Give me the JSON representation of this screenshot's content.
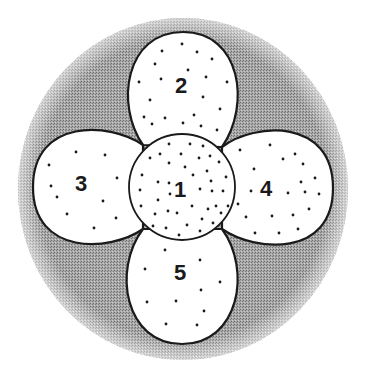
{
  "diagram": {
    "colors": {
      "background": "#ffffff",
      "outer_disc": "#9a9a9a",
      "region_fill": "#ffffff",
      "outline": "#1a1a1a",
      "dot": "#1a1a1a"
    },
    "outer_disc": {
      "cx": 183,
      "cy": 189,
      "rx": 165,
      "ry": 171
    },
    "center_region": {
      "label": "1",
      "cx": 182,
      "cy": 187,
      "r": 53,
      "label_pos": [
        180,
        190
      ],
      "dots": [
        [
          152,
          124
        ],
        [
          183,
          123
        ],
        [
          201,
          126
        ],
        [
          169,
          144
        ],
        [
          190,
          144
        ],
        [
          203,
          146
        ],
        [
          160,
          154
        ],
        [
          181,
          154
        ],
        [
          150,
          158
        ],
        [
          199,
          158
        ],
        [
          210,
          156
        ],
        [
          219,
          162
        ],
        [
          169,
          163
        ],
        [
          185,
          167
        ],
        [
          207,
          171
        ],
        [
          142,
          175
        ],
        [
          193,
          175
        ],
        [
          226,
          177
        ],
        [
          158,
          182
        ],
        [
          169,
          183
        ],
        [
          211,
          181
        ],
        [
          140,
          190
        ],
        [
          200,
          189
        ],
        [
          170,
          194
        ],
        [
          212,
          191
        ],
        [
          223,
          191
        ],
        [
          158,
          200
        ],
        [
          141,
          206
        ],
        [
          192,
          206
        ],
        [
          208,
          209
        ],
        [
          216,
          206
        ],
        [
          228,
          206
        ],
        [
          168,
          211
        ],
        [
          177,
          213
        ],
        [
          155,
          214
        ],
        [
          221,
          213
        ],
        [
          202,
          219
        ],
        [
          187,
          225
        ],
        [
          153,
          226
        ],
        [
          166,
          228
        ],
        [
          213,
          223
        ],
        [
          200,
          231
        ],
        [
          179,
          235
        ]
      ]
    },
    "petals": [
      {
        "id": "top",
        "label": "2",
        "path": "M143,145 C115,105 125,32 183,32 C241,32 251,105 222,147 Z",
        "label_pos": [
          181,
          86
        ],
        "dots": [
          [
            182,
            44
          ],
          [
            162,
            51
          ],
          [
            197,
            52
          ],
          [
            212,
            59
          ],
          [
            155,
            64
          ],
          [
            188,
            70
          ],
          [
            161,
            79
          ],
          [
            206,
            77
          ],
          [
            139,
            82
          ],
          [
            227,
            82
          ],
          [
            150,
            100
          ],
          [
            203,
            97
          ],
          [
            144,
            117
          ],
          [
            220,
            109
          ],
          [
            165,
            118
          ],
          [
            194,
            115
          ],
          [
            217,
            130
          ]
        ]
      },
      {
        "id": "left",
        "label": "3",
        "path": "M143,145 C110,122 33,118 33,187 C33,256 110,252 143,229 Z",
        "label_pos": [
          81,
          184
        ],
        "dots": [
          [
            76,
            152
          ],
          [
            105,
            155
          ],
          [
            49,
            165
          ],
          [
            117,
            178
          ],
          [
            51,
            186
          ],
          [
            57,
            197
          ],
          [
            103,
            201
          ],
          [
            67,
            214
          ],
          [
            116,
            218
          ],
          [
            94,
            228
          ]
        ]
      },
      {
        "id": "right",
        "label": "4",
        "path": "M222,147 C255,122 333,118 333,188 C333,258 255,252 222,229 Z",
        "label_pos": [
          266,
          189
        ],
        "dots": [
          [
            270,
            145
          ],
          [
            240,
            150
          ],
          [
            295,
            154
          ],
          [
            283,
            159
          ],
          [
            303,
            164
          ],
          [
            254,
            169
          ],
          [
            315,
            178
          ],
          [
            301,
            182
          ],
          [
            251,
            191
          ],
          [
            288,
            193
          ],
          [
            305,
            192
          ],
          [
            319,
            194
          ],
          [
            238,
            204
          ],
          [
            309,
            209
          ],
          [
            246,
            217
          ],
          [
            272,
            216
          ],
          [
            293,
            215
          ],
          [
            298,
            229
          ],
          [
            255,
            233
          ],
          [
            279,
            233
          ]
        ]
      },
      {
        "id": "bottom",
        "label": "5",
        "path": "M143,229 C112,270 125,344 182,344 C239,344 252,270 222,229 Z",
        "label_pos": [
          180,
          273
        ],
        "dots": [
          [
            165,
            250
          ],
          [
            200,
            260
          ],
          [
            145,
            269
          ],
          [
            220,
            282
          ],
          [
            201,
            290
          ],
          [
            147,
            302
          ],
          [
            176,
            301
          ],
          [
            204,
            311
          ],
          [
            166,
            324
          ],
          [
            197,
            325
          ]
        ]
      }
    ]
  }
}
